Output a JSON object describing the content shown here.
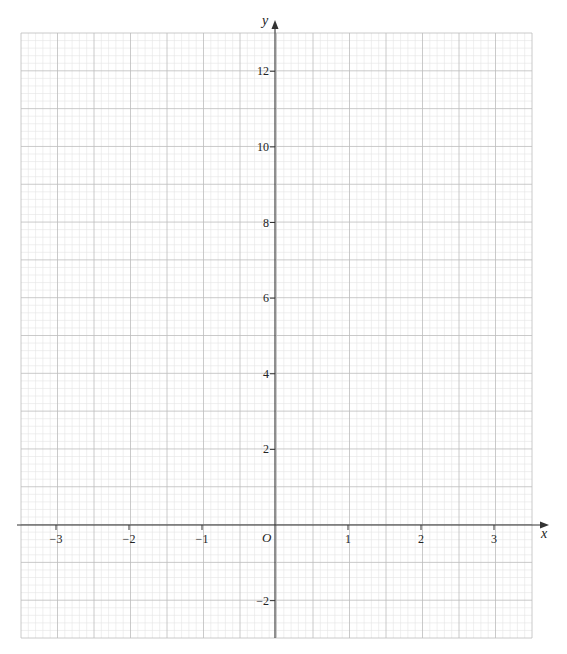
{
  "chart_data": {
    "type": "line",
    "title": "",
    "xlabel": "x",
    "ylabel": "y",
    "origin_label": "O",
    "xlim": [
      -3.5,
      3.5
    ],
    "ylim": [
      -3,
      13
    ],
    "grid": true,
    "x_ticks": [
      -3,
      -2,
      -1,
      1,
      2,
      3
    ],
    "x_tick_labels": [
      "−3",
      "−2",
      "−1",
      "1",
      "2",
      "3"
    ],
    "y_ticks": [
      -2,
      2,
      4,
      6,
      8,
      10,
      12
    ],
    "y_tick_labels": [
      "−2",
      "2",
      "4",
      "6",
      "8",
      "10",
      "12"
    ],
    "series": []
  },
  "colors": {
    "axis": "#333333",
    "major_grid": "#bdbdbd",
    "minor_grid": "#e4e4e4"
  }
}
